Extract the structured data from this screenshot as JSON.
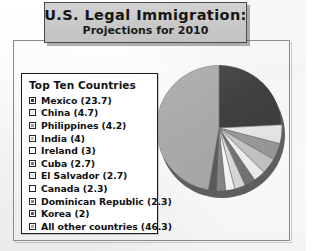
{
  "title": {
    "main": "U.S. Legal Immigration:",
    "sub": "Projections for 2010"
  },
  "legend": {
    "heading": "Top Ten Countries"
  },
  "chart_data": {
    "type": "pie",
    "title": "U.S. Legal Immigration: Projections for 2010",
    "legend_title": "Top Ten Countries",
    "legend_position": "left",
    "unit": "percent",
    "value_suffix": "",
    "categories": [
      "Mexico",
      "China",
      "Philippines",
      "India",
      "Ireland",
      "Cuba",
      "El Salvador",
      "Canada",
      "Dominican Republic",
      "Korea",
      "All other countries"
    ],
    "values": [
      23.7,
      4.7,
      4.2,
      4,
      3,
      2.7,
      2.7,
      2.3,
      2.3,
      2,
      46.3
    ],
    "labels": [
      "Mexico (23.7)",
      "China (4.7)",
      "Philippines (4.2)",
      "India (4)",
      "Ireland (3)",
      "Cuba (2.7)",
      "El Salvador (2.7)",
      "Canada (2.3)",
      "Dominican Republic (2.3)",
      "Korea (2)",
      "All other countries (46.3)"
    ],
    "colors": [
      "#3f3f3f",
      "#e8e8e8",
      "#9a9a9a",
      "#c6c6c6",
      "#f2f2f2",
      "#767676",
      "#dcdcdc",
      "#fafafa",
      "#888888",
      "#5c5c5c",
      "#a9a9a9"
    ],
    "start_angle": -90,
    "direction": "clockwise"
  },
  "colors": {
    "title_plaque": "#c9c9c9",
    "frame_border": "#8a8a8a",
    "legend_border": "#1d1d1d",
    "pie_depth": "#5e5e5e",
    "text": "#111111"
  }
}
